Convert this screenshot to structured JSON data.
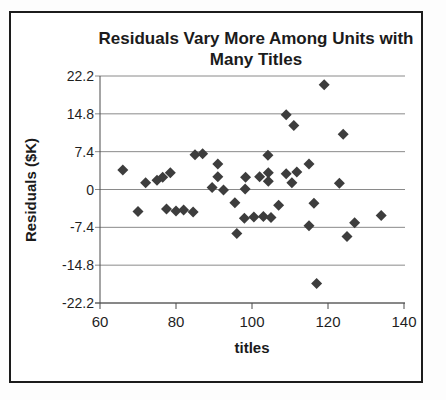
{
  "figure": {
    "title": "Residuals Vary More Among Units with Many Titles",
    "xlabel": "titles",
    "ylabel": "Residuals ($K)"
  },
  "chart_data": {
    "type": "scatter",
    "title": "Residuals Vary More Among Units with Many Titles",
    "xlabel": "titles",
    "ylabel": "Residuals ($K)",
    "xlim": [
      60,
      140
    ],
    "ylim": [
      -22.2,
      22.2
    ],
    "x_ticks": [
      60,
      80,
      100,
      120,
      140
    ],
    "y_ticks": [
      22.2,
      14.8,
      7.4,
      0,
      -7.4,
      -14.8,
      -22.2
    ],
    "grid": "horizontal",
    "legend": "none",
    "marker": {
      "shape": "diamond",
      "color": "#3d3d3d",
      "size": 11
    },
    "axis_color": "#4a4a4a",
    "grid_color": "#8a8a8a",
    "points": [
      [
        66,
        3.8
      ],
      [
        70,
        -4.3
      ],
      [
        72,
        1.3
      ],
      [
        75,
        1.8
      ],
      [
        76.5,
        2.4
      ],
      [
        78.5,
        3.3
      ],
      [
        77.5,
        -3.8
      ],
      [
        80,
        -4.2
      ],
      [
        82,
        -4.0
      ],
      [
        84.5,
        -4.4
      ],
      [
        85,
        6.8
      ],
      [
        87,
        7.0
      ],
      [
        89.5,
        0.4
      ],
      [
        91,
        5.0
      ],
      [
        91,
        2.5
      ],
      [
        92.5,
        -0.1
      ],
      [
        95.5,
        -2.6
      ],
      [
        96,
        -8.6
      ],
      [
        98.3,
        2.4
      ],
      [
        98.2,
        0.1
      ],
      [
        102,
        2.5
      ],
      [
        98,
        -5.6
      ],
      [
        100.5,
        -5.4
      ],
      [
        103,
        -5.3
      ],
      [
        105,
        -5.5
      ],
      [
        104.2,
        6.7
      ],
      [
        104.3,
        3.3
      ],
      [
        104.3,
        1.6
      ],
      [
        107,
        -3.1
      ],
      [
        109,
        14.6
      ],
      [
        111,
        12.5
      ],
      [
        109,
        3.1
      ],
      [
        111.8,
        3.4
      ],
      [
        110.5,
        1.3
      ],
      [
        115,
        5.0
      ],
      [
        115,
        -7.1
      ],
      [
        116.3,
        -2.7
      ],
      [
        117,
        -18.4
      ],
      [
        119,
        20.5
      ],
      [
        123,
        1.2
      ],
      [
        124,
        10.8
      ],
      [
        125,
        -9.2
      ],
      [
        127,
        -6.5
      ],
      [
        134,
        -5.1
      ]
    ]
  }
}
